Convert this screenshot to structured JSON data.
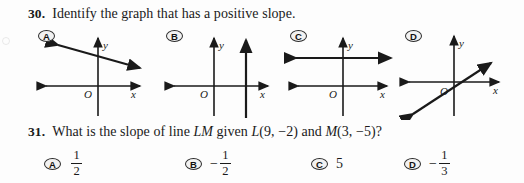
{
  "page": {
    "background": "#fdfdfd",
    "ink": "#1a1a1a"
  },
  "questions": [
    {
      "number": "30.",
      "prompt": "Identify the graph that has a positive slope.",
      "choices": [
        {
          "letter": "A",
          "graph": {
            "type": "line",
            "description": "line with negative slope crossing the y-axis above the origin",
            "slope_sign": "negative",
            "axis_labels": {
              "x": "x",
              "y": "y",
              "origin": "O"
            }
          }
        },
        {
          "letter": "B",
          "graph": {
            "type": "line",
            "description": "vertical line to the right of the y-axis",
            "slope_sign": "undefined",
            "axis_labels": {
              "x": "x",
              "y": "y",
              "origin": "O"
            }
          }
        },
        {
          "letter": "C",
          "graph": {
            "type": "line",
            "description": "horizontal line above the x-axis",
            "slope_sign": "zero",
            "axis_labels": {
              "x": "x",
              "y": "y",
              "origin": "O"
            }
          }
        },
        {
          "letter": "D",
          "graph": {
            "type": "line",
            "description": "line with positive slope passing through the origin region",
            "slope_sign": "positive",
            "axis_labels": {
              "x": "x",
              "y": "y",
              "origin": "O"
            }
          }
        }
      ]
    },
    {
      "number": "31.",
      "prompt_parts": {
        "lead": "What is the slope of line ",
        "line_name": "LM",
        "mid": " given ",
        "point_l": "L",
        "point_l_coords": "(9, −2)",
        "conj": " and ",
        "point_m": "M",
        "point_m_coords": "(3, −5)",
        "end": "?"
      },
      "choices": [
        {
          "letter": "A",
          "value_type": "fraction",
          "sign": "",
          "numerator": "1",
          "denominator": "2"
        },
        {
          "letter": "B",
          "value_type": "fraction",
          "sign": "−",
          "numerator": "1",
          "denominator": "2"
        },
        {
          "letter": "C",
          "value_type": "whole",
          "sign": "",
          "value": "5"
        },
        {
          "letter": "D",
          "value_type": "fraction",
          "sign": "−",
          "numerator": "1",
          "denominator": "3"
        }
      ]
    }
  ]
}
